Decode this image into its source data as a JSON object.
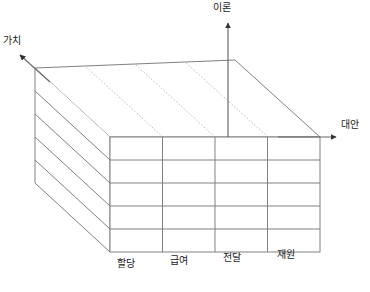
{
  "diagram": {
    "type": "3d-box-matrix",
    "axes": {
      "vertical": {
        "label": "이론",
        "name": "theory-axis"
      },
      "depth": {
        "label": "가치",
        "name": "value-axis"
      },
      "horizontal": {
        "label": "대안",
        "name": "option-axis"
      }
    },
    "columns": [
      {
        "label": "할당"
      },
      {
        "label": "급여"
      },
      {
        "label": "전달"
      },
      {
        "label": "재원"
      }
    ],
    "grid": {
      "rows": 5,
      "cols": 4,
      "depth_layers": 5
    },
    "colors": {
      "line": "#808080",
      "line_light": "#b9b9b9",
      "background": "#ffffff",
      "text": "#1a1a1a"
    }
  }
}
